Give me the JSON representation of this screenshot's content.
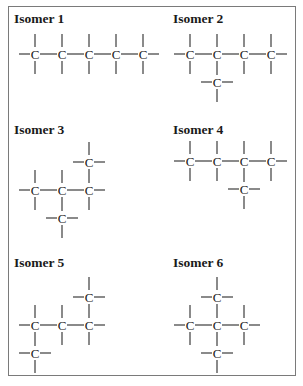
{
  "figure": {
    "border_color": "#7a7a7a",
    "bond_length_x": 27,
    "bond_length_y": 28,
    "panels": [
      {
        "title": "Isomer 1",
        "title_pos": [
          14,
          23
        ],
        "origin": [
          35,
          54
        ],
        "atoms": [
          [
            0,
            0
          ],
          [
            1,
            0
          ],
          [
            2,
            0
          ],
          [
            3,
            0
          ],
          [
            4,
            0
          ]
        ],
        "bonds": [
          [
            0,
            1
          ],
          [
            1,
            2
          ],
          [
            2,
            3
          ],
          [
            3,
            4
          ]
        ]
      },
      {
        "title": "Isomer 2",
        "title_pos": [
          173,
          23
        ],
        "origin": [
          190,
          54
        ],
        "atoms": [
          [
            0,
            0
          ],
          [
            1,
            0
          ],
          [
            2,
            0
          ],
          [
            3,
            0
          ],
          [
            1,
            1
          ]
        ],
        "bonds": [
          [
            0,
            1
          ],
          [
            1,
            2
          ],
          [
            2,
            3
          ],
          [
            1,
            4
          ]
        ]
      },
      {
        "title": "Isomer 3",
        "title_pos": [
          14,
          134
        ],
        "origin": [
          35,
          190
        ],
        "atoms": [
          [
            0,
            0
          ],
          [
            1,
            0
          ],
          [
            2,
            0
          ],
          [
            2,
            -1
          ],
          [
            1,
            1
          ]
        ],
        "bonds": [
          [
            0,
            1
          ],
          [
            1,
            2
          ],
          [
            2,
            3
          ],
          [
            1,
            4
          ]
        ]
      },
      {
        "title": "Isomer 4",
        "title_pos": [
          173,
          134
        ],
        "origin": [
          190,
          161
        ],
        "atoms": [
          [
            0,
            0
          ],
          [
            1,
            0
          ],
          [
            2,
            0
          ],
          [
            3,
            0
          ],
          [
            2,
            1
          ]
        ],
        "bonds": [
          [
            0,
            1
          ],
          [
            1,
            2
          ],
          [
            2,
            3
          ],
          [
            2,
            4
          ]
        ]
      },
      {
        "title": "Isomer 5",
        "title_pos": [
          14,
          267
        ],
        "origin": [
          35,
          325
        ],
        "atoms": [
          [
            0,
            0
          ],
          [
            1,
            0
          ],
          [
            2,
            0
          ],
          [
            2,
            -1
          ],
          [
            0,
            1
          ]
        ],
        "bonds": [
          [
            0,
            1
          ],
          [
            1,
            2
          ],
          [
            2,
            3
          ],
          [
            0,
            4
          ]
        ]
      },
      {
        "title": "Isomer 6",
        "title_pos": [
          173,
          267
        ],
        "origin": [
          190,
          325
        ],
        "atoms": [
          [
            0,
            0
          ],
          [
            1,
            0
          ],
          [
            2,
            0
          ],
          [
            1,
            -1
          ],
          [
            1,
            1
          ]
        ],
        "bonds": [
          [
            0,
            1
          ],
          [
            1,
            2
          ],
          [
            1,
            3
          ],
          [
            1,
            4
          ]
        ]
      }
    ],
    "atom_label": "C"
  }
}
